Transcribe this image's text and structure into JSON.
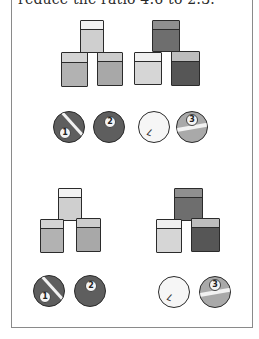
{
  "caption": "reduce the ratio 4:6 to 2:3.",
  "colors": {
    "light_top": "#ececec",
    "light_face": "#d6d6d6",
    "mid_face": "#b4b4b4",
    "mid_top": "#cfcfcf",
    "dark_face": "#6f6f6f",
    "darker_face": "#585858",
    "dark_top": "#8e8e8e",
    "white_face": "#e2e2e2",
    "ball_dark": "#5e5e5e",
    "ball_white": "#f6f6f6",
    "ball_grey": "#a9a9a9"
  },
  "groups": [
    {
      "name": "top-light-cubes",
      "cubes": [
        {
          "x": 80,
          "y": 20,
          "w": 24,
          "h": 33,
          "face": "#cfcfcf",
          "top": "#f2f2f2"
        },
        {
          "x": 61,
          "y": 52,
          "w": 27,
          "h": 35,
          "face": "#b2b2b2",
          "top": "#d4d4d4"
        },
        {
          "x": 97,
          "y": 52,
          "w": 26,
          "h": 34,
          "face": "#a8a8a8",
          "top": "#cccccc"
        }
      ]
    },
    {
      "name": "top-dark-cubes",
      "cubes": [
        {
          "x": 152,
          "y": 20,
          "w": 28,
          "h": 32,
          "face": "#6e6e6e",
          "top": "#8f8f8f"
        },
        {
          "x": 134,
          "y": 52,
          "w": 28,
          "h": 33,
          "face": "#d6d6d6",
          "top": "#efefef"
        },
        {
          "x": 171,
          "y": 51,
          "w": 29,
          "h": 35,
          "face": "#565656",
          "top": "#bdbdbd"
        }
      ]
    },
    {
      "name": "bottom-light-cubes",
      "cubes": [
        {
          "x": 58,
          "y": 188,
          "w": 24,
          "h": 33,
          "face": "#cfcfcf",
          "top": "#f2f2f2"
        },
        {
          "x": 40,
          "y": 219,
          "w": 24,
          "h": 34,
          "face": "#b2b2b2",
          "top": "#d4d4d4"
        },
        {
          "x": 76,
          "y": 218,
          "w": 25,
          "h": 34,
          "face": "#a8a8a8",
          "top": "#cccccc"
        }
      ]
    },
    {
      "name": "bottom-dark-cubes",
      "cubes": [
        {
          "x": 174,
          "y": 188,
          "w": 29,
          "h": 33,
          "face": "#6e6e6e",
          "top": "#8f8f8f"
        },
        {
          "x": 156,
          "y": 219,
          "w": 26,
          "h": 34,
          "face": "#d6d6d6",
          "top": "#efefef"
        },
        {
          "x": 191,
          "y": 218,
          "w": 29,
          "h": 34,
          "face": "#565656",
          "top": "#bdbdbd"
        }
      ]
    }
  ],
  "balls": [
    {
      "id": "ball-1-top",
      "label": "1",
      "type": "stripe-dark",
      "x": 53,
      "y": 111
    },
    {
      "id": "ball-2-top",
      "label": "2",
      "type": "solid-dark",
      "x": 93,
      "y": 111
    },
    {
      "id": "ball-7-top",
      "label": "7",
      "type": "cue-white",
      "x": 138,
      "y": 111
    },
    {
      "id": "ball-3-top",
      "label": "3",
      "type": "stripe-grey",
      "x": 176,
      "y": 111
    },
    {
      "id": "ball-1-bottom",
      "label": "1",
      "type": "stripe-dark",
      "x": 33,
      "y": 275
    },
    {
      "id": "ball-2-bottom",
      "label": "2",
      "type": "solid-dark",
      "x": 74,
      "y": 275
    },
    {
      "id": "ball-7-bottom",
      "label": "7",
      "type": "cue-white",
      "x": 158,
      "y": 276
    },
    {
      "id": "ball-3-bottom",
      "label": "3",
      "type": "stripe-grey",
      "x": 199,
      "y": 276
    }
  ]
}
